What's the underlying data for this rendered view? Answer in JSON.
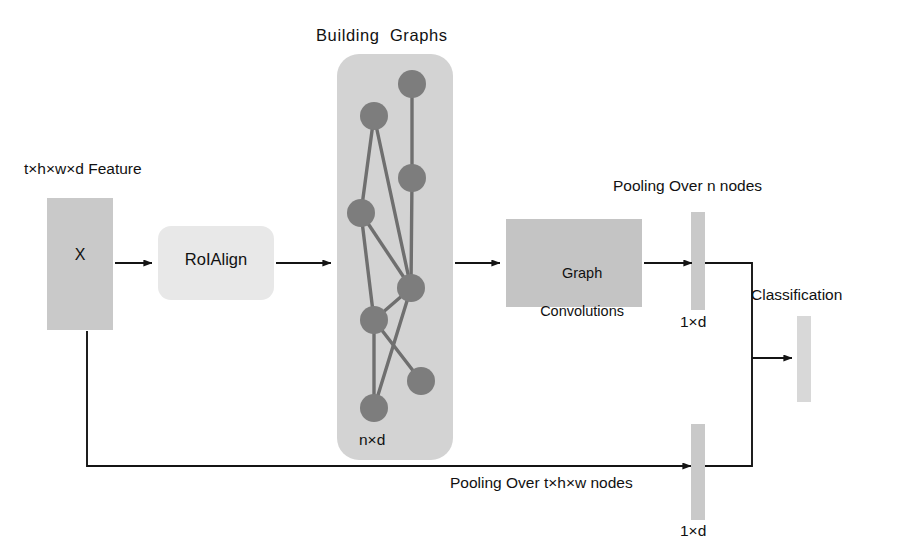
{
  "diagram": {
    "colors": {
      "feature_block": "#c9c9c9",
      "roialign_block": "#e8e8e8",
      "graph_panel": "#d3d3d3",
      "graph_node": "#7d7d7d",
      "graph_edge": "#6f6f6f",
      "graphconv_block": "#c4c4c4",
      "pooling_bar": "#c9c9c9",
      "classification_bar": "#d8d8d8",
      "arrow": "#141414",
      "text": "#111111",
      "background": "#ffffff"
    },
    "labels": {
      "feature_input": "t×h×w×d Feature",
      "feature_block_text": "X",
      "roialign": "RoIAlign",
      "building_graphs": "Building  Graphs",
      "graph_panel_dims": "n×d",
      "graph_convolutions_line1": "Graph",
      "graph_convolutions_line2": "Convolutions",
      "pooling_over_n": "Pooling Over n nodes",
      "pooled_top_dims": "1×d",
      "pooling_over_thw": "Pooling Over t×h×w nodes",
      "pooled_bottom_dims": "1×d",
      "classification": "Classification"
    },
    "graph": {
      "node_count": 8,
      "nodes": [
        {
          "id": "n1",
          "cx": 412,
          "cy": 84,
          "r": 14
        },
        {
          "id": "n2",
          "cx": 374,
          "cy": 116,
          "r": 14
        },
        {
          "id": "n3",
          "cx": 412,
          "cy": 178,
          "r": 14
        },
        {
          "id": "n4",
          "cx": 361,
          "cy": 213,
          "r": 14
        },
        {
          "id": "n5",
          "cx": 411,
          "cy": 288,
          "r": 14
        },
        {
          "id": "n6",
          "cx": 374,
          "cy": 320,
          "r": 14
        },
        {
          "id": "n7",
          "cx": 421,
          "cy": 381,
          "r": 14
        },
        {
          "id": "n8",
          "cx": 374,
          "cy": 408,
          "r": 14
        }
      ],
      "edges": [
        [
          "n1",
          "n3"
        ],
        [
          "n3",
          "n5"
        ],
        [
          "n2",
          "n4"
        ],
        [
          "n2",
          "n5"
        ],
        [
          "n4",
          "n5"
        ],
        [
          "n4",
          "n6"
        ],
        [
          "n5",
          "n6"
        ],
        [
          "n5",
          "n8"
        ],
        [
          "n6",
          "n7"
        ],
        [
          "n7",
          "n5"
        ],
        [
          "n6",
          "n8"
        ]
      ]
    }
  }
}
